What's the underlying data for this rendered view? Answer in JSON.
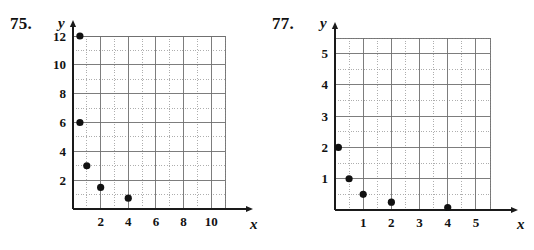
{
  "page": {
    "background": "#ffffff",
    "ink": "#111111",
    "grid_major_color": "#6f6f6f",
    "grid_minor_color": "#9a9a9a",
    "axis_color": "#1a1a1a",
    "point_color": "#111111"
  },
  "problems": [
    {
      "number": "75.",
      "x_axis_label": "x",
      "y_axis_label": "y"
    },
    {
      "number": "77.",
      "x_axis_label": "x",
      "y_axis_label": "y"
    }
  ],
  "chart_data": [
    {
      "type": "scatter",
      "title": "75.",
      "xlabel": "x",
      "ylabel": "y",
      "xlim": [
        0,
        11
      ],
      "ylim": [
        0,
        12
      ],
      "xticks": [
        2,
        4,
        6,
        8,
        10
      ],
      "yticks": [
        2,
        4,
        6,
        8,
        10,
        12
      ],
      "xtick_labels": [
        "2",
        "4",
        "6",
        "8",
        "10"
      ],
      "ytick_labels": [
        "2",
        "4",
        "6",
        "8",
        "10",
        "12"
      ],
      "x_major_step": 2,
      "x_minor_step": 1,
      "y_major_step": 2,
      "y_minor_step": 1,
      "grid": true,
      "grid_style": "major solid, minor dotted",
      "legend": "none",
      "points": [
        {
          "x": 0.5,
          "y": 12
        },
        {
          "x": 0.5,
          "y": 6
        },
        {
          "x": 1,
          "y": 3
        },
        {
          "x": 2,
          "y": 1.5
        },
        {
          "x": 4,
          "y": 0.75
        }
      ]
    },
    {
      "type": "scatter",
      "title": "77.",
      "xlabel": "x",
      "ylabel": "y",
      "xlim": [
        0,
        5.5
      ],
      "ylim": [
        0,
        5.5
      ],
      "xticks": [
        1,
        2,
        3,
        4,
        5
      ],
      "yticks": [
        1,
        2,
        3,
        4,
        5
      ],
      "xtick_labels": [
        "1",
        "2",
        "3",
        "4",
        "5"
      ],
      "ytick_labels": [
        "1",
        "2",
        "3",
        "4",
        "5"
      ],
      "x_major_step": 1,
      "x_minor_step": 0.5,
      "y_major_step": 1,
      "y_minor_step": 0.5,
      "grid": true,
      "grid_style": "major solid, minor dotted",
      "legend": "none",
      "points": [
        {
          "x": 0.12,
          "y": 2
        },
        {
          "x": 0.5,
          "y": 1
        },
        {
          "x": 1,
          "y": 0.5
        },
        {
          "x": 2,
          "y": 0.25
        },
        {
          "x": 4,
          "y": 0.08
        }
      ]
    }
  ]
}
